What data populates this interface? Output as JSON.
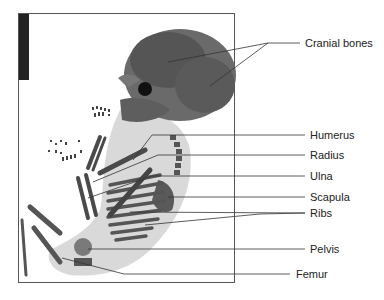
{
  "figure": {
    "frame": {
      "x": 18,
      "y": 13,
      "width": 216,
      "height": 269
    }
  },
  "labels": [
    {
      "id": "cranial-bones",
      "text": "Cranial bones",
      "x": 305,
      "y": 37
    },
    {
      "id": "humerus",
      "text": "Humerus",
      "x": 310,
      "y": 131
    },
    {
      "id": "radius",
      "text": "Radius",
      "x": 310,
      "y": 151
    },
    {
      "id": "ulna",
      "text": "Ulna",
      "x": 310,
      "y": 172
    },
    {
      "id": "scapula",
      "text": "Scapula",
      "x": 310,
      "y": 193
    },
    {
      "id": "ribs",
      "text": "Ribs",
      "x": 310,
      "y": 209
    },
    {
      "id": "pelvis",
      "text": "Pelvis",
      "x": 310,
      "y": 245
    },
    {
      "id": "femur",
      "text": "Femur",
      "x": 296,
      "y": 270
    }
  ],
  "colors": {
    "bone": "#4a4a4a",
    "tissue": "#b9b9b9",
    "line": "#333333",
    "frame": "#555555"
  }
}
